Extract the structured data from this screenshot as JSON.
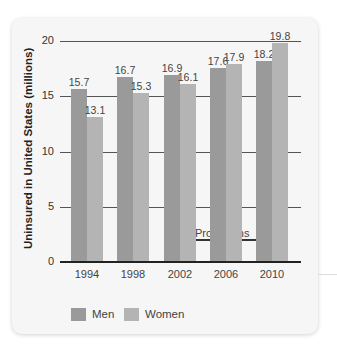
{
  "chart_data": {
    "type": "bar",
    "title": "",
    "xlabel": "Year",
    "ylabel": "Uninsured in United States (millions)",
    "categories": [
      "1994",
      "1998",
      "2002",
      "2006",
      "2010"
    ],
    "series": [
      {
        "name": "Men",
        "values": [
          15.7,
          16.7,
          16.9,
          17.6,
          18.2
        ],
        "color": "#9a9a9a"
      },
      {
        "name": "Women",
        "values": [
          13.1,
          15.3,
          16.1,
          17.9,
          19.8
        ],
        "color": "#b4b4b4"
      }
    ],
    "ylim": [
      0,
      20
    ],
    "yticks": [
      "0",
      "5",
      "10",
      "15",
      "20"
    ],
    "grid": true,
    "legend_position": "bottom",
    "annotations": [
      {
        "text": "Projections",
        "from": "2002",
        "to": "2010",
        "type": "arrow"
      }
    ]
  },
  "labels": {
    "ylabel": "Uninsured in United States (millions)",
    "xlabel": "Year",
    "projections": "Projections",
    "legend_men": "Men",
    "legend_women": "Women"
  }
}
